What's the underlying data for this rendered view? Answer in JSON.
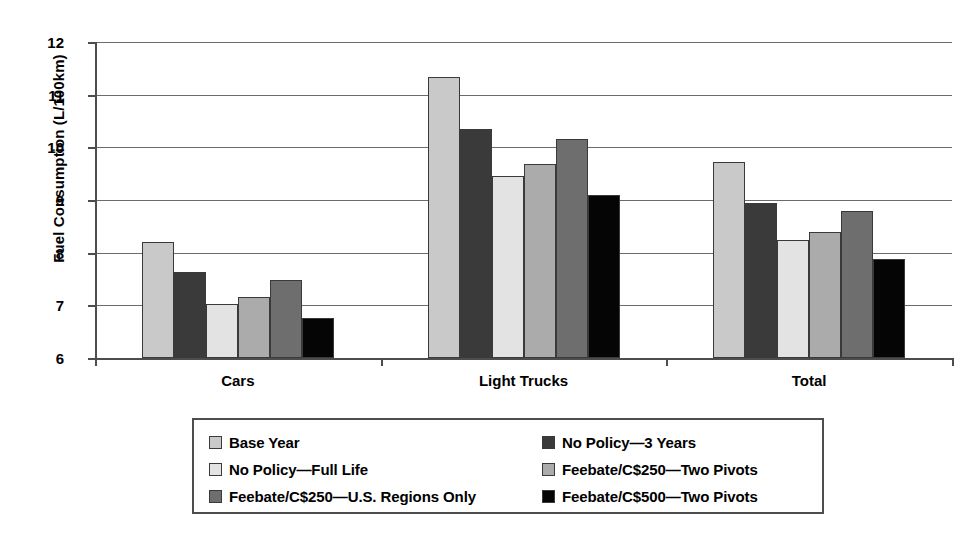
{
  "chart_data": {
    "type": "bar",
    "title": "",
    "xlabel": "",
    "ylabel": "Fuel Consumption (L/100km)",
    "ylim": [
      6,
      12
    ],
    "yticks": [
      6,
      7,
      8,
      9,
      10,
      11,
      12
    ],
    "ytick_labels": [
      "6",
      "7",
      "8",
      "9",
      "10",
      "11",
      "12"
    ],
    "grid": true,
    "legend_position": "bottom",
    "legend_columns": 2,
    "categories": [
      "Cars",
      "Light Trucks",
      "Total"
    ],
    "series": [
      {
        "name": "Base Year",
        "color": "#c9c9c9",
        "values": [
          8.2,
          11.33,
          9.72
        ]
      },
      {
        "name": "No Policy—3 Years",
        "color": "#3a3a3a",
        "values": [
          7.63,
          10.35,
          8.95
        ]
      },
      {
        "name": "No Policy—Full Life",
        "color": "#e3e3e3",
        "values": [
          7.02,
          9.45,
          8.25
        ]
      },
      {
        "name": "Feebate/C$250—Two Pivots",
        "color": "#ababab",
        "values": [
          7.15,
          9.68,
          8.4
        ]
      },
      {
        "name": "Feebate/C$250—U.S. Regions Only",
        "color": "#6e6e6e",
        "values": [
          7.48,
          10.16,
          8.8
        ]
      },
      {
        "name": "Feebate/C$500—Two Pivots",
        "color": "#050505",
        "values": [
          6.76,
          9.1,
          7.88
        ]
      }
    ]
  },
  "legend": {
    "items": [
      {
        "label": "Base Year",
        "swatch": "#c9c9c9"
      },
      {
        "label": "No Policy—3 Years",
        "swatch": "#3a3a3a"
      },
      {
        "label": "No Policy—Full Life",
        "swatch": "#e3e3e3"
      },
      {
        "label": "Feebate/C$250—Two Pivots",
        "swatch": "#ababab"
      },
      {
        "label": "Feebate/C$250—U.S. Regions Only",
        "swatch": "#6e6e6e"
      },
      {
        "label": "Feebate/C$500—Two Pivots",
        "swatch": "#050505"
      }
    ]
  }
}
